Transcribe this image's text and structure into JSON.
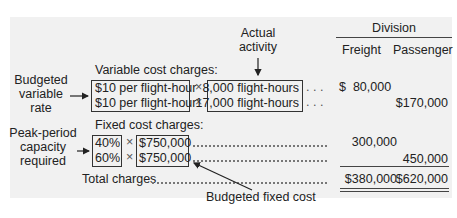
{
  "header": {
    "actual_activity_line1": "Actual",
    "actual_activity_line2": "activity",
    "division": "Division",
    "columns": [
      "Freight",
      "Passenger"
    ]
  },
  "variable": {
    "section_label": "Variable cost charges:",
    "side_label": [
      "Budgeted",
      "variable",
      "rate"
    ],
    "rows": [
      {
        "rate": "$10 per flight-hour",
        "times": "×",
        "activity": "8,000 flight-hours",
        "leader": ". . .",
        "freight": "$  80,000",
        "passenger": ""
      },
      {
        "rate": "$10 per flight-hour",
        "times": "×",
        "activity": "17,000 flight-hours",
        "leader": ". . .",
        "freight": "",
        "passenger": "$170,000"
      }
    ]
  },
  "fixed": {
    "section_label": "Fixed cost charges:",
    "side_label": [
      "Peak-period",
      "capacity",
      "required"
    ],
    "rows": [
      {
        "pct": "40%",
        "times": "×",
        "budget": "$750,000",
        "freight": "300,000",
        "passenger": ""
      },
      {
        "pct": "60%",
        "times": "×",
        "budget": "$750,000",
        "freight": "",
        "passenger": "450,000"
      }
    ],
    "annotation": "Budgeted fixed cost"
  },
  "totals": {
    "label": "Total charges",
    "freight": "$380,000",
    "passenger": "$620,000"
  }
}
